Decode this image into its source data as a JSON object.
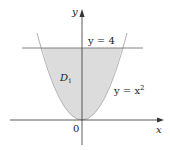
{
  "diagram": {
    "axes": {
      "x_label": "x",
      "y_label": "y",
      "origin_label": "0"
    },
    "region": {
      "label": "D",
      "subscript": "1",
      "fill": "#dcdcdc"
    },
    "curves": [
      {
        "name": "parabola",
        "equation_lhs": "y = x",
        "exponent": "2"
      },
      {
        "name": "horizontal-line",
        "equation": "y = 4"
      }
    ],
    "colors": {
      "axis": "#333333",
      "curve": "#b0b0b0",
      "line": "#555555"
    }
  }
}
